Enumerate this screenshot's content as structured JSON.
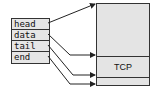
{
  "struct": {
    "fields": [
      {
        "label": "head"
      },
      {
        "label": "data"
      },
      {
        "label": "tail"
      },
      {
        "label": "end"
      }
    ]
  },
  "buffer": {
    "segment_label": "TCP"
  }
}
